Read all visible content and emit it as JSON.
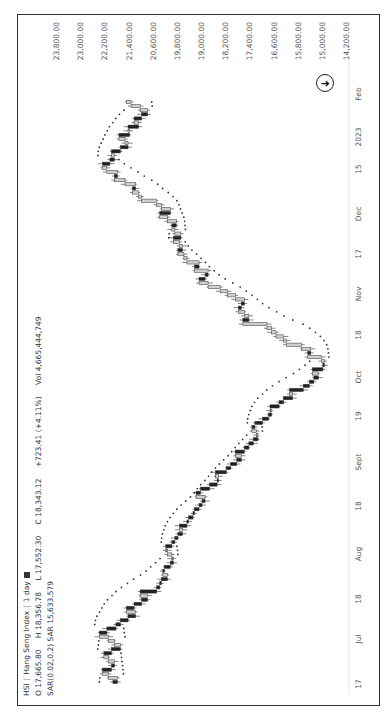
{
  "legend": {
    "symbol": "HSI",
    "name": "Hang Seng Index",
    "interval": "1 day",
    "ohlc": {
      "open_label": "O",
      "open": "17,665.80",
      "high_label": "H",
      "high": "18,356.78",
      "low_label": "L",
      "low": "17,552.30",
      "close_label": "C",
      "close": "18,343.12",
      "change": "+723.41 (+4.11%)"
    },
    "volume_label": "Vol",
    "volume": "4,665,444,749",
    "sar_label": "SAR(0.02,0.2)",
    "sar_value_label": "SAR",
    "sar_value": "15,633.579"
  },
  "scroll_button": {
    "icon": "arrow-right-icon",
    "glyph": "➜"
  },
  "colors": {
    "up": "#cfcfcf",
    "down": "#222222",
    "sar": "#333333",
    "border": "#333333"
  },
  "chart_data": {
    "type": "candlestick",
    "orientation_note": "image is rotated 90 degrees; time runs bottom to top",
    "xlabel": "",
    "ylabel": "",
    "x_ticks": [
      "17",
      "Jul",
      "18",
      "Aug",
      "18",
      "Sept",
      "19",
      "Oct",
      "18",
      "Nov",
      "17",
      "Dec",
      "15",
      "2023",
      "Feb"
    ],
    "y_ticks": [
      "23,800.00",
      "23,000.00",
      "22,200.00",
      "21,400.00",
      "20,600.00",
      "19,800.00",
      "19,000.00",
      "18,200.00",
      "17,400.00",
      "16,600.00",
      "15,800.00",
      "15,000.00",
      "14,200.00"
    ],
    "ylim": [
      14200,
      23800
    ],
    "grid": false,
    "series": [
      {
        "name": "HSI close (approx.)",
        "values": [
          21600,
          21900,
          22100,
          21800,
          21700,
          21900,
          22050,
          21800,
          21500,
          21700,
          21900,
          22200,
          21950,
          21650,
          21500,
          21250,
          21000,
          21300,
          21050,
          20800,
          20600,
          20850,
          20300,
          20200,
          20150,
          19950,
          20100,
          20050,
          19850,
          19750,
          19800,
          19950,
          20000,
          19800,
          19700,
          19600,
          19450,
          19550,
          19300,
          19250,
          19100,
          19050,
          18900,
          18800,
          18700,
          19000,
          18850,
          18550,
          18300,
          18250,
          18350,
          18000,
          17850,
          17650,
          17500,
          17700,
          17400,
          17250,
          17100,
          16950,
          17000,
          17150,
          17050,
          16800,
          16600,
          16500,
          16550,
          16250,
          16100,
          15800,
          15900,
          15450,
          15250,
          15100,
          14950,
          15150,
          14800,
          14750,
          14850,
          15300,
          15200,
          15500,
          16000,
          16100,
          16350,
          16500,
          16650,
          17450,
          17250,
          17400,
          17600,
          17500,
          17400,
          17700,
          17950,
          18200,
          18600,
          18900,
          18700,
          18600,
          19050,
          18900,
          19300,
          19400,
          19600,
          19450,
          19550,
          19750,
          19500,
          19700,
          19800,
          19650,
          19950,
          20200,
          19850,
          20150,
          20300,
          20800,
          20900,
          21100,
          21000,
          21350,
          21700,
          21600,
          21950,
          22100,
          21850,
          21700,
          21800,
          21500,
          21250,
          21350,
          21550,
          21200,
          21250,
          20900,
          21050,
          20800,
          20600,
          20850,
          21150,
          21300
        ]
      },
      {
        "name": "SAR(0.02,0.2)",
        "type": "dots"
      }
    ],
    "last": {
      "open": 17665.8,
      "high": 18356.78,
      "low": 17552.3,
      "close": 18343.12,
      "change": 723.41,
      "change_pct": 4.11,
      "volume": 4665444749,
      "sar": 15633.579
    }
  }
}
